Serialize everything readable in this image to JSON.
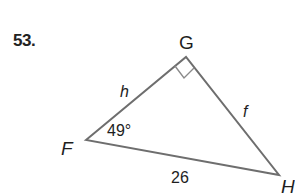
{
  "problem": {
    "number": "53."
  },
  "triangle": {
    "vertices": {
      "F": {
        "label": "F",
        "x": 86,
        "y": 140
      },
      "G": {
        "label": "G",
        "x": 186,
        "y": 57
      },
      "H": {
        "label": "H",
        "x": 279,
        "y": 175
      }
    },
    "right_angle_at": "G",
    "sides": {
      "FG": {
        "label": "h"
      },
      "GH": {
        "label": "f"
      },
      "FH": {
        "label": "26"
      }
    },
    "angles": {
      "F": {
        "label": "49°"
      }
    },
    "colors": {
      "stroke": "#6e6e6e",
      "text": "#1e1e1e"
    }
  }
}
